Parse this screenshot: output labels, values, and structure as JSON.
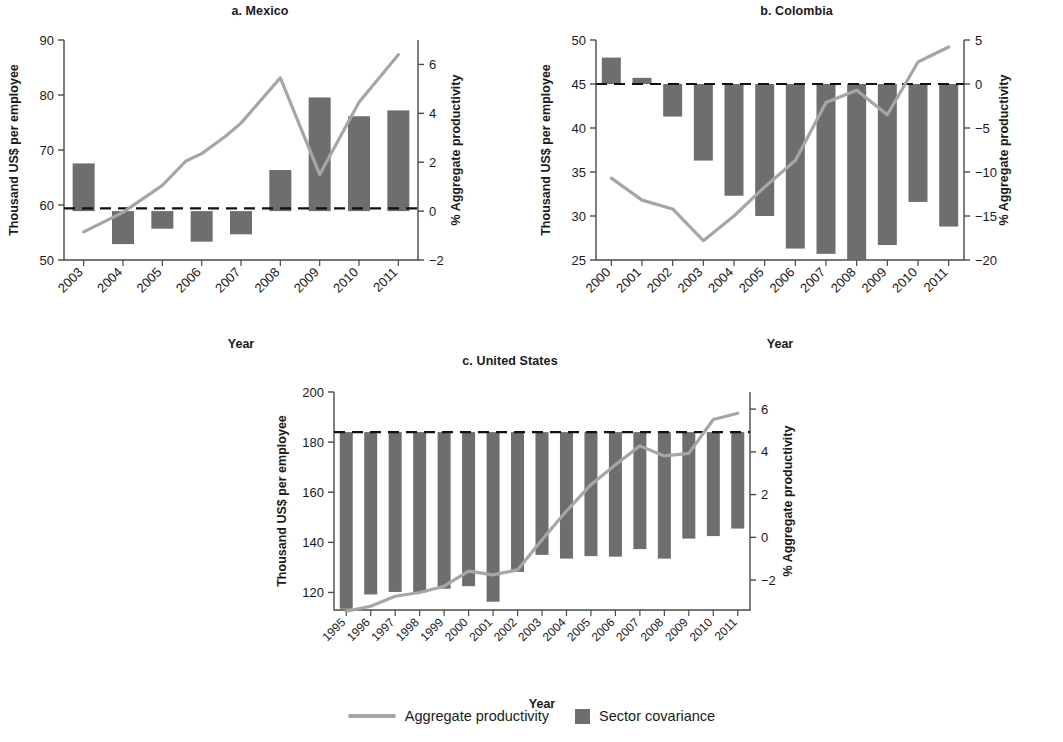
{
  "figure": {
    "legend": {
      "line_label": "Aggregate productivity",
      "bar_label": "Sector covariance",
      "line_color": "#a6a6a6",
      "bar_color": "#6e6e6e"
    }
  },
  "chart_data": [
    {
      "type": "bar",
      "id": "mexico",
      "title": "a. Mexico",
      "xlabel": "Year",
      "ylabel": "Thousand US$ per employee",
      "ylabel_right": "% Aggregate productivity",
      "categories": [
        "2003",
        "2004",
        "2005",
        "2006",
        "2007",
        "2008",
        "2009",
        "2010",
        "2011"
      ],
      "ylim": [
        50,
        90
      ],
      "yticks": [
        50,
        60,
        70,
        80,
        90
      ],
      "ylim_right": [
        -2,
        7
      ],
      "yticks_right": [
        -2,
        0,
        2,
        4,
        6
      ],
      "zero_left_value": 59.4,
      "grid": false,
      "legend_position": "bottom-center",
      "series": [
        {
          "name": "Sector covariance",
          "axis": "right",
          "kind": "bar",
          "values": [
            1.95,
            -1.35,
            -0.72,
            -1.25,
            -0.95,
            1.68,
            4.65,
            3.88,
            4.12
          ]
        },
        {
          "name": "Aggregate productivity",
          "axis": "right",
          "kind": "line",
          "values": [
            -0.85,
            -0.05,
            1.05,
            2.05,
            2.35,
            3.05,
            3.6,
            5.45,
            1.5,
            4.45,
            6.4
          ]
        }
      ],
      "line_x": [
        "2003",
        "2004",
        "2005",
        "2005.6",
        "2006",
        "2006.6",
        "2007",
        "2008",
        "2009",
        "2010",
        "2011"
      ]
    },
    {
      "type": "bar",
      "id": "colombia",
      "title": "b. Colombia",
      "xlabel": "Year",
      "ylabel": "Thousand US$ per employee",
      "ylabel_right": "% Aggregate productivity",
      "categories": [
        "2000",
        "2001",
        "2002",
        "2003",
        "2004",
        "2005",
        "2006",
        "2007",
        "2008",
        "2009",
        "2010",
        "2011"
      ],
      "ylim": [
        25,
        50
      ],
      "yticks": [
        25,
        30,
        35,
        40,
        45,
        50
      ],
      "ylim_right": [
        -20,
        5
      ],
      "yticks_right": [
        -20,
        -15,
        -10,
        -5,
        0,
        5
      ],
      "zero_left_value": 45,
      "grid": false,
      "legend_position": "bottom-center",
      "series": [
        {
          "name": "Sector covariance",
          "axis": "right",
          "kind": "bar",
          "values": [
            3.0,
            0.7,
            -3.7,
            -8.7,
            -12.7,
            -15.0,
            -18.7,
            -19.3,
            -20.0,
            -18.3,
            -13.4,
            -16.2
          ]
        },
        {
          "name": "Aggregate productivity",
          "axis": "right",
          "kind": "line",
          "values": [
            -10.7,
            -13.2,
            -14.2,
            -17.8,
            -15.0,
            -11.7,
            -8.7,
            -2.1,
            -0.7,
            -3.5,
            2.5,
            4.2
          ]
        }
      ]
    },
    {
      "type": "bar",
      "id": "united-states",
      "title": "c. United States",
      "xlabel": "Year",
      "ylabel": "Thousand US$ per employee",
      "ylabel_right": "% Aggregate productivity",
      "categories": [
        "1995",
        "1996",
        "1997",
        "1998",
        "1999",
        "2000",
        "2001",
        "2002",
        "2003",
        "2004",
        "2005",
        "2006",
        "2007",
        "2008",
        "2009",
        "2010",
        "2011"
      ],
      "ylim": [
        113,
        200
      ],
      "yticks": [
        120,
        140,
        160,
        180,
        200
      ],
      "ylim_right": [
        -3.4,
        6.8
      ],
      "yticks_right": [
        -2,
        0,
        2,
        4,
        6
      ],
      "zero_left_value": 184,
      "grid": false,
      "legend_position": "bottom-center",
      "series": [
        {
          "name": "Sector covariance",
          "axis": "left",
          "kind": "bar",
          "bar_bottoms": [
            113.5,
            119.2,
            120.2,
            120.0,
            121.5,
            122.5,
            116.3,
            128.2,
            135.0,
            133.5,
            134.5,
            134.3,
            137.3,
            133.5,
            141.5,
            142.5,
            145.5
          ]
        },
        {
          "name": "Aggregate productivity",
          "axis": "left",
          "kind": "line",
          "line_left_values": [
            112.5,
            114.5,
            118.5,
            120.0,
            122.5,
            128.5,
            127.0,
            129.0,
            141.0,
            152.5,
            163.0,
            171.0,
            178.5,
            174.5,
            175.5,
            189.0,
            191.5
          ]
        }
      ]
    }
  ]
}
